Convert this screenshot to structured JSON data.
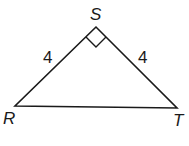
{
  "diagram": {
    "type": "right isosceles triangle",
    "vertices": {
      "S": {
        "label": "S",
        "x": 96,
        "y": 27
      },
      "R": {
        "label": "R",
        "x": 15,
        "y": 106
      },
      "T": {
        "label": "T",
        "x": 177,
        "y": 108
      }
    },
    "sides": {
      "RS": {
        "length_label": "4"
      },
      "ST": {
        "length_label": "4"
      },
      "RT": {
        "length_label": ""
      }
    },
    "right_angle_at": "S",
    "stroke_color": "#1a1a1a",
    "background": "#ffffff"
  }
}
